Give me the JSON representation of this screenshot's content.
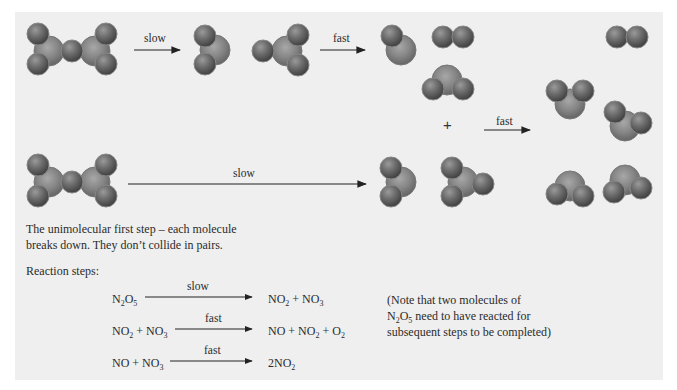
{
  "diagram": {
    "top_row": {
      "arrow1_label": "slow",
      "arrow2_label": "fast"
    },
    "middle": {
      "plus": "+",
      "arrow3_label": "fast"
    },
    "bottom_row": {
      "arrow_label": "slow"
    },
    "description": {
      "line1": "The unimolecular first step – each molecule",
      "line2": "breaks down. They don’t collide in pairs."
    },
    "reaction_steps": {
      "heading": "Reaction steps:",
      "steps": [
        {
          "reactants": [
            {
              "t": "N"
            },
            {
              "s": "2"
            },
            {
              "t": "O"
            },
            {
              "s": "5"
            }
          ],
          "condition": "slow",
          "products": [
            {
              "t": "NO"
            },
            {
              "s": "2"
            },
            {
              "t": " + NO"
            },
            {
              "s": "3"
            }
          ]
        },
        {
          "reactants": [
            {
              "t": "NO"
            },
            {
              "s": "2"
            },
            {
              "t": " + NO"
            },
            {
              "s": "3"
            }
          ],
          "condition": "fast",
          "products": [
            {
              "t": "NO + NO"
            },
            {
              "s": "2"
            },
            {
              "t": " + O"
            },
            {
              "s": "2"
            }
          ]
        },
        {
          "reactants": [
            {
              "t": "NO + NO"
            },
            {
              "s": "3"
            }
          ],
          "condition": "fast",
          "products": [
            {
              "t": "2NO"
            },
            {
              "s": "2"
            }
          ]
        }
      ]
    },
    "note": {
      "line1": "(Note that two molecules of",
      "line2_formula": [
        {
          "t": "N"
        },
        {
          "s": "2"
        },
        {
          "t": "O"
        },
        {
          "s": "5"
        }
      ],
      "line2_rest": " need to have reacted for",
      "line3": "subsequent steps to be completed)"
    },
    "colors": {
      "background": "#efefef",
      "atom_dark": "#555555",
      "atom_light": "#8a8a8a",
      "arrow": "#222222"
    }
  }
}
